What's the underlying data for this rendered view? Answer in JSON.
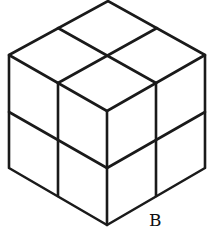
{
  "diagram": {
    "stroke_color": "#1a1a1a",
    "background": "#ffffff",
    "vertices": {
      "top": [
        108,
        1
      ],
      "left_top": [
        9,
        55
      ],
      "right_top": [
        205,
        55
      ],
      "front_top": [
        107,
        111
      ],
      "left_bottom": [
        9,
        168
      ],
      "right_bottom": [
        205,
        168
      ],
      "front_bottom": [
        107,
        225
      ]
    },
    "labels": [
      {
        "text": "B",
        "x": 149,
        "y": 226
      }
    ]
  }
}
